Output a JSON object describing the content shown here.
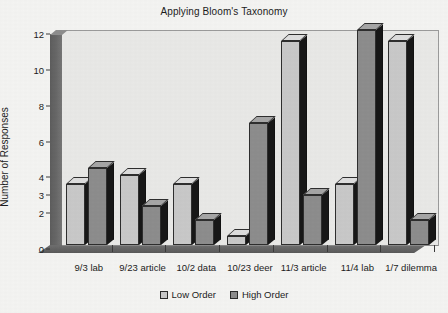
{
  "chart_data": {
    "type": "bar",
    "title": "Applying Bloom's Taxonomy",
    "xlabel": "",
    "ylabel": "Number of Responses",
    "ylim": [
      0,
      12
    ],
    "grid": false,
    "legend_position": "bottom",
    "style": "3d-grouped-bar-grayscale",
    "ytick_labels": [
      "0",
      "2",
      "3",
      "4",
      "6",
      "8",
      "10",
      "12"
    ],
    "ytick_values": [
      0,
      2,
      3,
      4,
      6,
      8,
      10,
      12
    ],
    "categories": [
      "9/3 lab",
      "9/23 article",
      "10/2 data",
      "10/23 deer",
      "11/3 article",
      "11/4 lab",
      "1/7 dilemma"
    ],
    "series": [
      {
        "name": "Low Order",
        "color": "#c9c9c9",
        "values": [
          3.4,
          3.9,
          3.4,
          0.5,
          11.4,
          3.4,
          11.4
        ]
      },
      {
        "name": "High Order",
        "color": "#8d8d8d",
        "values": [
          4.3,
          2.2,
          1.4,
          6.8,
          2.8,
          12.0,
          1.4
        ]
      }
    ]
  },
  "legend": {
    "items": [
      {
        "label": "Low Order",
        "swatch": "low"
      },
      {
        "label": "High Order",
        "swatch": "high"
      }
    ]
  },
  "colors": {
    "page_background": "#f4f4f2",
    "plot_background": "#e9e9e7",
    "low_order": "#c9c9c9",
    "high_order": "#8d8d8d",
    "bar_outline": "#2e2e2e",
    "bar_shadow": "#171717",
    "axis": "#3a3a3a",
    "text": "#1c1c1c"
  }
}
